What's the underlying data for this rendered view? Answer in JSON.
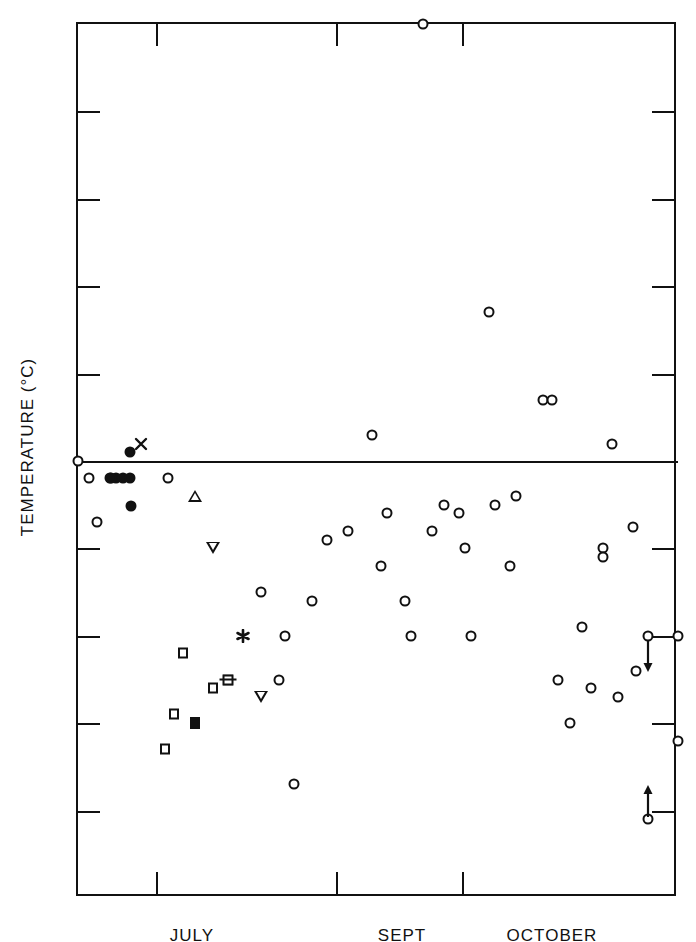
{
  "chart_data": {
    "type": "scatter",
    "title": "",
    "xlabel": "",
    "ylabel": "TEMPERATURE (°C)",
    "ylim": [
      -5,
      5
    ],
    "yticks": [
      5,
      4,
      3,
      2,
      1,
      0,
      -1,
      -2,
      -3,
      -4,
      -5
    ],
    "ytick_labels": [
      "5",
      "4",
      "3",
      "2",
      "1",
      "0",
      "−1",
      "−2",
      "−3",
      "−4",
      "−5"
    ],
    "xlim": [
      0,
      100
    ],
    "xtick_labels": [
      "JULY",
      "SEPT",
      "OCTOBER"
    ],
    "xtick_label_positions": [
      19,
      54,
      79
    ],
    "xtick_positions": [
      13,
      43,
      64
    ],
    "grid": false,
    "legend": null,
    "zero_line": true,
    "series": [
      {
        "name": "open-circle",
        "marker": "open-circle",
        "points": [
          {
            "x": 0.0,
            "y": 0.0
          },
          {
            "x": 1.8,
            "y": -0.2
          },
          {
            "x": 3.2,
            "y": -0.7
          },
          {
            "x": 15.0,
            "y": -0.2
          },
          {
            "x": 30.5,
            "y": -1.5
          },
          {
            "x": 33.5,
            "y": -2.5
          },
          {
            "x": 34.5,
            "y": -2.0
          },
          {
            "x": 36.0,
            "y": -3.7
          },
          {
            "x": 39.0,
            "y": -1.6
          },
          {
            "x": 41.5,
            "y": -0.9
          },
          {
            "x": 45.0,
            "y": -0.8
          },
          {
            "x": 49.0,
            "y": 0.3
          },
          {
            "x": 50.5,
            "y": -1.2
          },
          {
            "x": 51.5,
            "y": -0.6
          },
          {
            "x": 54.5,
            "y": -1.6
          },
          {
            "x": 55.5,
            "y": -2.0
          },
          {
            "x": 59.0,
            "y": -0.8
          },
          {
            "x": 61.0,
            "y": -0.5
          },
          {
            "x": 63.5,
            "y": -0.6
          },
          {
            "x": 64.5,
            "y": -1.0
          },
          {
            "x": 65.5,
            "y": -2.0
          },
          {
            "x": 68.5,
            "y": 1.7
          },
          {
            "x": 69.5,
            "y": -0.5
          },
          {
            "x": 72.0,
            "y": -1.2
          },
          {
            "x": 73.0,
            "y": -0.4
          },
          {
            "x": 77.5,
            "y": 0.7
          },
          {
            "x": 79.0,
            "y": 0.7
          },
          {
            "x": 80.0,
            "y": -2.5
          },
          {
            "x": 82.0,
            "y": -3.0
          },
          {
            "x": 84.0,
            "y": -1.9
          },
          {
            "x": 85.5,
            "y": -2.6
          },
          {
            "x": 87.5,
            "y": -1.0
          },
          {
            "x": 87.5,
            "y": -1.1
          },
          {
            "x": 89.0,
            "y": 0.2
          },
          {
            "x": 90.0,
            "y": -2.7
          },
          {
            "x": 92.5,
            "y": -0.75
          },
          {
            "x": 93.0,
            "y": -2.4
          },
          {
            "x": 57.5,
            "y": 5.0
          },
          {
            "x": 95.0,
            "y": -2.0
          },
          {
            "x": 100.0,
            "y": -2.0
          },
          {
            "x": 100.0,
            "y": -3.2
          },
          {
            "x": 95.0,
            "y": -4.1
          }
        ]
      },
      {
        "name": "filled-circle",
        "marker": "filled-circle",
        "points": [
          {
            "x": 5.3,
            "y": -0.2
          },
          {
            "x": 6.4,
            "y": -0.2
          },
          {
            "x": 7.5,
            "y": -0.2
          },
          {
            "x": 8.7,
            "y": -0.2
          },
          {
            "x": 8.7,
            "y": 0.1
          },
          {
            "x": 8.8,
            "y": -0.52
          },
          {
            "x": 5.5,
            "y": -0.2
          }
        ]
      },
      {
        "name": "x-cross",
        "marker": "x",
        "points": [
          {
            "x": 10.5,
            "y": 0.2
          }
        ]
      },
      {
        "name": "asterisk",
        "marker": "asterisk",
        "points": [
          {
            "x": 27.5,
            "y": -2.0
          }
        ]
      },
      {
        "name": "triangle-up",
        "marker": "triangle-up",
        "points": [
          {
            "x": 19.5,
            "y": -0.4
          }
        ]
      },
      {
        "name": "triangle-down",
        "marker": "triangle-down",
        "points": [
          {
            "x": 22.5,
            "y": -1.0
          },
          {
            "x": 30.5,
            "y": -2.7
          }
        ]
      },
      {
        "name": "open-square",
        "marker": "open-square",
        "points": [
          {
            "x": 17.5,
            "y": -2.2
          },
          {
            "x": 16.0,
            "y": -2.9
          },
          {
            "x": 14.5,
            "y": -3.3
          },
          {
            "x": 22.5,
            "y": -2.6
          },
          {
            "x": 25.0,
            "y": -2.5
          }
        ]
      },
      {
        "name": "filled-square",
        "marker": "filled-square",
        "points": [
          {
            "x": 19.5,
            "y": -3.0
          }
        ]
      },
      {
        "name": "crossed-square",
        "marker": "crossed-square",
        "points": [
          {
            "x": 25.0,
            "y": -2.5
          }
        ]
      }
    ],
    "annotations": [
      {
        "kind": "arrow-down",
        "x": 95.0,
        "y": -2.0,
        "label": ""
      },
      {
        "kind": "arrow-up",
        "x": 95.0,
        "y": -4.1,
        "label": ""
      }
    ]
  }
}
